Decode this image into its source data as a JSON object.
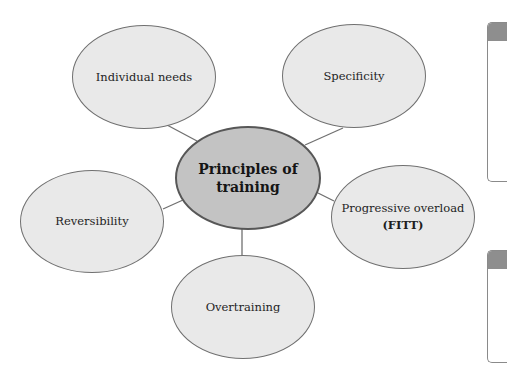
{
  "diagram": {
    "title": "Principles of training",
    "center": {
      "label_line1": "Principles of",
      "label_line2": "training"
    },
    "nodes": [
      {
        "id": "individual-needs",
        "label": "Individual needs"
      },
      {
        "id": "specificity",
        "label": "Specificity"
      },
      {
        "id": "reversibility",
        "label": "Reversibility"
      },
      {
        "id": "progressive-overload",
        "label": "Progressive overload",
        "sub": "(FITT)"
      },
      {
        "id": "overtraining",
        "label": "Overtraining"
      }
    ],
    "colors": {
      "outer_fill": "#e9e9e9",
      "outer_border": "#707070",
      "center_fill": "#c3c3c3",
      "center_border": "#575757",
      "connector": "#707070"
    }
  }
}
